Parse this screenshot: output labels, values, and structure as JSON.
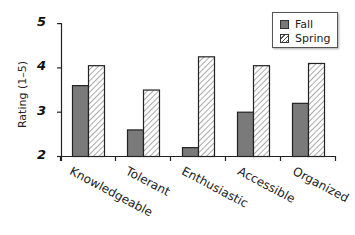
{
  "chart_data": {
    "type": "bar",
    "title": "",
    "xlabel": "",
    "ylabel": "Rating (1–5)",
    "ylim": [
      2,
      5
    ],
    "yticks": [
      2,
      3,
      4,
      5
    ],
    "grid": false,
    "legend_position": "top-right",
    "categories": [
      "Knowledgeable",
      "Tolerant",
      "Enthusiastic",
      "Accessible",
      "Organized"
    ],
    "series": [
      {
        "name": "Fall",
        "color": "#7a7a7a",
        "pattern": "solid",
        "values": [
          3.6,
          2.6,
          2.2,
          3.0,
          3.2
        ]
      },
      {
        "name": "Spring",
        "color": "#ffffff",
        "pattern": "hatched",
        "values": [
          4.05,
          3.5,
          4.25,
          4.05,
          4.1
        ]
      }
    ]
  },
  "axis": {
    "ylabel": "Rating (1–5)",
    "ytick_labels": [
      "5",
      "4",
      "3",
      "2"
    ]
  },
  "legend": {
    "items": [
      {
        "label": "Fall"
      },
      {
        "label": "Spring"
      }
    ]
  }
}
